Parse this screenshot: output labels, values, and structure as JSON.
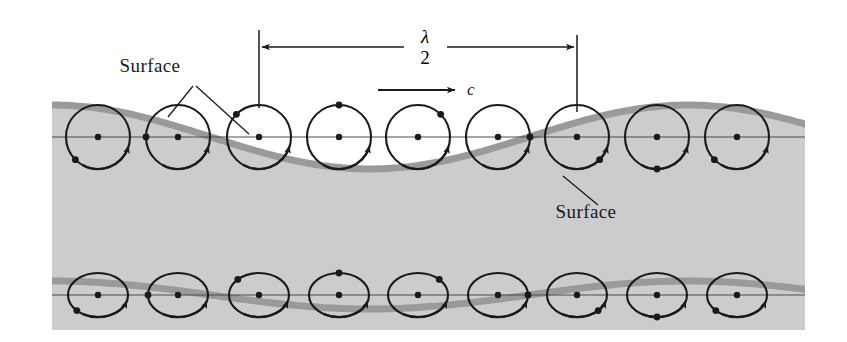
{
  "figure": {
    "name": "water-wave-orbital-motion-diagram",
    "background_color": "#ffffff",
    "water_fill_color": "#cccccc",
    "wave_band_color": "#9a9a9a",
    "ink_color": "#1a1a1a",
    "width": 847,
    "height": 342
  },
  "labels": {
    "surface_upper": "Surface",
    "surface_lower": "Surface",
    "wavelength_numerator": "λ",
    "wavelength_denominator": "2",
    "celerity": "c"
  },
  "dimension": {
    "name": "half-wavelength",
    "left_x": 259,
    "right_x": 577,
    "line_y": 47,
    "tick_top_y": 30,
    "tick_bottom_y_left": 108,
    "tick_bottom_y_right": 112,
    "label_text": "λ/2"
  },
  "celerity_arrow": {
    "x_start": 378,
    "x_end": 455,
    "y": 90,
    "direction": "right",
    "label": "c"
  },
  "chart_data": {
    "type": "line",
    "xlabel": "",
    "ylabel": "",
    "grid": false,
    "legend": "none",
    "annotations": [
      "Surface",
      "Surface",
      "λ/2",
      "c"
    ],
    "water_region": {
      "x_left": 52,
      "x_right": 805,
      "y_bottom": 330
    },
    "series": [
      {
        "name": "upper-surface-wave",
        "description": "Free surface profile, large amplitude",
        "amplitude": 32,
        "wavelength": 636,
        "mean_level_y": 137,
        "phase_deg": 0,
        "band_width": 7,
        "x": [
          52,
          98,
          178,
          259,
          339,
          418,
          498,
          577,
          657,
          737,
          805
        ],
        "y": [
          168,
          150,
          120,
          106,
          120,
          150,
          168,
          170,
          153,
          123,
          110
        ]
      },
      {
        "name": "lower-surface-wave",
        "description": "Attenuated internal streamline at depth, reduced amplitude",
        "amplitude": 14,
        "wavelength": 636,
        "mean_level_y": 295,
        "phase_deg": 0,
        "band_width": 7,
        "x": [
          52,
          98,
          178,
          259,
          339,
          418,
          498,
          577,
          657,
          737,
          805
        ],
        "y": [
          317,
          308,
          292,
          283,
          290,
          305,
          315,
          317,
          311,
          297,
          286
        ]
      }
    ],
    "orbit_rows": [
      {
        "name": "upper-orbits",
        "shape": "circle",
        "count": 9,
        "radius_x": 32,
        "radius_y": 32,
        "center_y": 137,
        "rotation": "clockwise",
        "centers_x": [
          98,
          178,
          259,
          339,
          418,
          498,
          577,
          657,
          737
        ],
        "phase_deg": [
          225,
          270,
          315,
          0,
          45,
          90,
          135,
          180,
          225
        ]
      },
      {
        "name": "lower-orbits",
        "shape": "ellipse",
        "count": 9,
        "radius_x": 30,
        "radius_y": 22,
        "center_y": 295,
        "rotation": "clockwise",
        "centers_x": [
          98,
          178,
          259,
          339,
          418,
          498,
          577,
          657,
          737
        ],
        "phase_deg": [
          225,
          270,
          315,
          0,
          45,
          90,
          135,
          180,
          225
        ]
      }
    ]
  },
  "leaders": {
    "surface_upper_label": {
      "x": 150,
      "y": 66
    },
    "surface_upper_left_line": {
      "x1": 193,
      "y1": 86,
      "x2": 168,
      "y2": 117
    },
    "surface_upper_right_line": {
      "x1": 196,
      "y1": 86,
      "x2": 249,
      "y2": 134
    },
    "surface_lower_label": {
      "x": 586,
      "y": 212
    },
    "surface_lower_line": {
      "x1": 598,
      "y1": 205,
      "x2": 563,
      "y2": 176
    }
  }
}
